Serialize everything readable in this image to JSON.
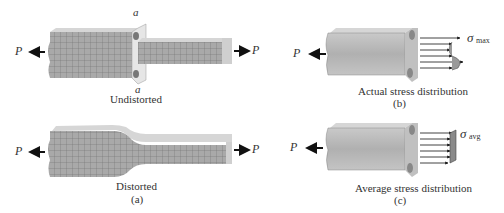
{
  "panel_a": {
    "undistorted": {
      "section_label_top": "a",
      "section_label_bottom": "a",
      "caption": "Undistorted",
      "load_left": "P",
      "load_right": "P"
    },
    "distorted": {
      "caption": "Distorted",
      "panel_letter": "(a)",
      "load_left": "P",
      "load_right": "P"
    }
  },
  "panel_b": {
    "load": "P",
    "stress_symbol": "σ",
    "stress_subscript": "max",
    "caption": "Actual stress distribution",
    "panel_letter": "(b)"
  },
  "panel_c": {
    "load": "P",
    "stress_symbol": "σ",
    "stress_subscript": "avg",
    "caption": "Average stress distribution",
    "panel_letter": "(c)"
  },
  "colors": {
    "bar_fill": "#b8b8b8",
    "bar_top": "#d8d8d8",
    "grid": "#7a7a7a",
    "arrow": "#111111"
  }
}
